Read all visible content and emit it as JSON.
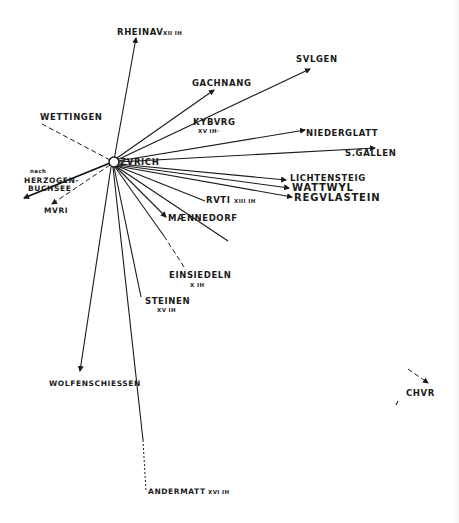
{
  "diagram": {
    "type": "radial-route-map",
    "center": {
      "id": "zurich",
      "label": "ZVRICH",
      "x": 114,
      "y": 162
    },
    "colors": {
      "ink": "#1a1a1a",
      "background": "#ffffff"
    },
    "nodes": [
      {
        "id": "rheinau",
        "label": "RHEINAV",
        "sublabel": "XII IH",
        "x": 136,
        "y": 38
      },
      {
        "id": "gachnang",
        "label": "GACHNANG",
        "x": 214,
        "y": 88
      },
      {
        "id": "svlgen",
        "label": "SVLGEN",
        "x": 310,
        "y": 68
      },
      {
        "id": "kybvrg",
        "label": "KYBVRG",
        "sublabel": "XV IH",
        "x": 213,
        "y": 125
      },
      {
        "id": "niederglatt",
        "label": "NIEDERGLATT",
        "x": 305,
        "y": 130
      },
      {
        "id": "sgallen",
        "label": "S.GALLEN",
        "x": 375,
        "y": 148
      },
      {
        "id": "lichtensteig",
        "label": "LICHTENSTEIG",
        "x": 286,
        "y": 180
      },
      {
        "id": "wattwyl",
        "label": "WATTWYL",
        "x": 289,
        "y": 187
      },
      {
        "id": "regvlastein",
        "label": "REGVLASTEIN",
        "x": 292,
        "y": 197
      },
      {
        "id": "rvti",
        "label": "RVTI",
        "sublabel": "XIII IH",
        "x": 203,
        "y": 200
      },
      {
        "id": "maennedorf",
        "label": "MÆNNEDORF",
        "x": 166,
        "y": 218
      },
      {
        "id": "einsiedeln",
        "label": "EINSIEDELN",
        "sublabel": "X IH",
        "x": 186,
        "y": 271
      },
      {
        "id": "steinen",
        "label": "STEINEN",
        "sublabel": "XV IH",
        "x": 143,
        "y": 300
      },
      {
        "id": "wolfenschiessen",
        "label": "WOLFENSCHIESSEN",
        "x": 82,
        "y": 373
      },
      {
        "id": "andermatt",
        "label": "ANDERMATT",
        "sublabel": "XVI IH",
        "x": 146,
        "y": 493
      },
      {
        "id": "wettingen",
        "label": "WETTINGEN",
        "x": 42,
        "y": 124
      },
      {
        "id": "herzogenbuchsee",
        "label": "HERZOGEN-BUCHSEE",
        "prefix": "nach",
        "x": 24,
        "y": 198
      },
      {
        "id": "mvri",
        "label": "MVRI",
        "x": 52,
        "y": 204
      },
      {
        "id": "chvr",
        "label": "CHVR",
        "x": 403,
        "y": 386
      }
    ],
    "labels": {
      "zurich": "ZVRICH",
      "rheinau": "RHEINAV",
      "rheinau_sub": "XII IH",
      "gachnang": "GACHNANG",
      "svlgen": "SVLGEN",
      "kybvrg": "KYBVRG",
      "kybvrg_sub": "XV IH·",
      "niederglatt": "NIEDERGLATT",
      "sgallen": "S.GALLEN",
      "lichtensteig": "LICHTENSTEIG",
      "wattwyl": "WATTWYL",
      "regvlastein": "REGVLASTEIN",
      "rvti": "RVTI",
      "rvti_sub": "XIII IH",
      "maennedorf": "MÆNNEDORF",
      "einsiedeln": "EINSIEDELN",
      "einsiedeln_sub": "X IH",
      "steinen": "STEINEN",
      "steinen_sub": "XV IH",
      "wolfenschiessen": "WOLFENSCHIESSEN",
      "andermatt": "ANDERMATT",
      "andermatt_sub": "XVI IH",
      "wettingen": "WETTINGEN",
      "herzogen_prefix": "nach",
      "herzogen_1": "HERZOGEN-",
      "herzogen_2": "BUCHSEE",
      "mvri": "MVRI",
      "chvr": "CHVR"
    }
  }
}
